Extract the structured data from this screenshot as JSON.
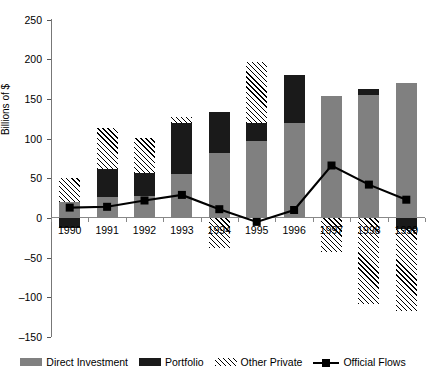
{
  "chart_data": {
    "type": "bar",
    "subtype": "stacked-bar-with-line",
    "title": "",
    "xlabel": "",
    "ylabel": "Billions of $",
    "categories": [
      "1990",
      "1991",
      "1992",
      "1993",
      "1994",
      "1995",
      "1996",
      "1997",
      "1998",
      "1999"
    ],
    "ylim": [
      -150,
      250
    ],
    "yticks": [
      -150,
      -100,
      -50,
      0,
      50,
      100,
      150,
      200,
      250
    ],
    "ytick_labels": [
      "-150",
      "-100",
      "-50",
      "0",
      "50",
      "100",
      "150",
      "200",
      "250"
    ],
    "grid": false,
    "legend_position": "bottom",
    "series": [
      {
        "name": "Direct Investment",
        "type": "bar-segment",
        "color": "#808080",
        "values": [
          20,
          27,
          28,
          55,
          82,
          97,
          120,
          153,
          155,
          170
        ]
      },
      {
        "name": "Portfolio",
        "type": "bar-segment",
        "color": "#1a1a1a",
        "values": [
          -13,
          35,
          28,
          65,
          51,
          23,
          60,
          0,
          7,
          -14
        ]
      },
      {
        "name": "Other Private",
        "type": "bar-segment",
        "color": "hatched",
        "values": [
          30,
          51,
          45,
          7,
          -38,
          76,
          0,
          -43,
          -108,
          -103
        ]
      },
      {
        "name": "Official Flows",
        "type": "line",
        "color": "#000000",
        "values": [
          13,
          14,
          22,
          29,
          11,
          -5,
          10,
          66,
          42,
          23
        ]
      }
    ],
    "legend": [
      {
        "label": "Direct Investment",
        "swatch": "solid-gray"
      },
      {
        "label": "Portfolio",
        "swatch": "solid-black"
      },
      {
        "label": "Other Private",
        "swatch": "hatched"
      },
      {
        "label": "Official Flows",
        "swatch": "line-marker"
      }
    ]
  }
}
